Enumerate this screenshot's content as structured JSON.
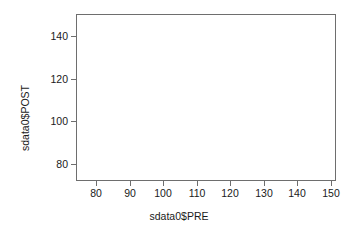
{
  "chart_data": {
    "type": "scatter",
    "title": "",
    "xlabel": "sdata0$PRE",
    "ylabel": "sdata0$POST",
    "xlim": [
      74.0,
      151.5
    ],
    "ylim": [
      72.0,
      150.5
    ],
    "grid": false,
    "legend": null,
    "x_ticks": [
      80,
      90,
      100,
      110,
      120,
      130,
      140,
      150
    ],
    "x_tick_labels": [
      "80",
      "90",
      "100",
      "110",
      "120",
      "130",
      "140",
      "150"
    ],
    "y_ticks": [
      80,
      100,
      120,
      140
    ],
    "y_tick_labels": [
      "80",
      "100",
      "120",
      "140"
    ],
    "series": [
      {
        "name": "sdata0",
        "x": [],
        "y": []
      }
    ],
    "annotations": [],
    "note": "Plot region is empty - axes and labels rendered with no plotted data points"
  },
  "figure": {
    "background_color": "#ffffff",
    "axis_color": "#6e6e6e",
    "text_color": "#1a1a1a",
    "box_border": true
  }
}
